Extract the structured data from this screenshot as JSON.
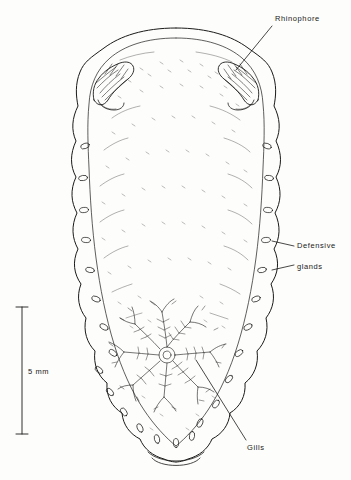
{
  "figure": {
    "type": "biological-line-drawing",
    "labels": [
      {
        "id": "rhinophore",
        "text": "Rhinophore"
      },
      {
        "id": "defensive",
        "text": "Defensive"
      },
      {
        "id": "glands",
        "text": "glands"
      },
      {
        "id": "gills",
        "text": "Gills"
      }
    ],
    "scale_bar": {
      "text": "5 mm"
    },
    "colors": {
      "ink": "#1a1a1a",
      "paper": "#fdfdfb",
      "stipple": "#3a3a3a"
    }
  }
}
